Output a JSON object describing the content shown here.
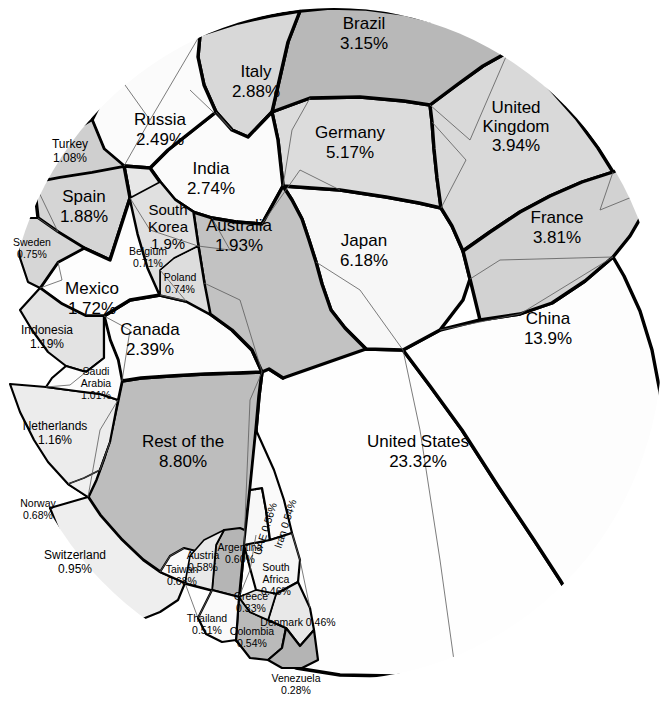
{
  "chart_data": {
    "type": "treemap",
    "subtype": "voronoi-treemap",
    "title": "",
    "subtitle": "",
    "xlabel": "",
    "ylabel": "",
    "unit": "percent",
    "legend": "none",
    "grid": false,
    "categories": [
      "United States",
      "China",
      "Rest of the World",
      "Japan",
      "Germany",
      "United Kingdom",
      "France",
      "Brazil",
      "Italy",
      "India",
      "Russia",
      "Canada",
      "Australia",
      "South Korea",
      "Spain",
      "Mexico",
      "Indonesia",
      "Netherlands",
      "Turkey",
      "Saudi Arabia",
      "Switzerland",
      "Sweden",
      "Poland",
      "Belgium",
      "Taiwan",
      "Norway",
      "Argentina",
      "Austria",
      "UAE",
      "Iran",
      "Colombia",
      "Thailand",
      "South Africa",
      "Denmark",
      "Greece",
      "Venezuela"
    ],
    "values": [
      23.32,
      13.9,
      8.8,
      6.18,
      5.17,
      3.94,
      3.81,
      3.15,
      2.88,
      2.74,
      2.49,
      2.39,
      1.93,
      1.9,
      1.88,
      1.72,
      1.19,
      1.16,
      1.08,
      1.01,
      0.95,
      0.75,
      0.74,
      0.71,
      0.68,
      0.68,
      0.6,
      0.58,
      0.56,
      0.54,
      0.54,
      0.51,
      0.46,
      0.46,
      0.33,
      0.28
    ],
    "value_labels": [
      "23.32%",
      "13.9%",
      "8.80%",
      "6.18%",
      "5.17%",
      "3.94%",
      "3.81%",
      "3.15%",
      "2.88%",
      "2.74%",
      "2.49%",
      "2.39%",
      "1.93%",
      "1.9%",
      "1.88%",
      "1.72%",
      "1.19%",
      "1.16%",
      "1.08%",
      "1.01%",
      "0.95%",
      "0.75%",
      "0.74%",
      "0.71%",
      "0.68%",
      "0.68%",
      "0.60%",
      "0.58%",
      "0.56%",
      "0.54%",
      "0.54%",
      "0.51%",
      "0.46%",
      "0.46%",
      "0.33%",
      "0.28%"
    ]
  },
  "cells": [
    {
      "id": "united-states",
      "name": "United States",
      "value": "23.32%",
      "fill": "#fefefe",
      "label_x": 418,
      "label_y": 453,
      "label_size": "lab-lg",
      "rotate": 0,
      "two_line": true,
      "stroke": "lvl-major",
      "points": "283,378 269,369 265,366 262,372 259,396 256,430 250,490 244,545 239,597 236,640 247,650 296,668 340,675 395,676 455,668 512,650 557,628 580,613 560,580 534,540 498,486 462,430 430,386 403,350 366,349 336,350 310,360"
    },
    {
      "id": "china",
      "name": "China",
      "value": "13.9%",
      "fill": "#fdfdfd",
      "label_x": 548,
      "label_y": 330,
      "label_size": "lab-lg",
      "rotate": 0,
      "two_line": true,
      "stroke": "lvl-major",
      "points": "403,350 430,386 462,430 498,486 534,540 560,580 580,613 610,585 632,552 648,515 658,476 662,434 660,392 652,350 640,311 624,276 613,257 585,281 552,303 520,314 480,320 440,330"
    },
    {
      "id": "rest-of-the-world",
      "name": "Rest of the World",
      "value": "8.80%",
      "fill": "#bdbdbd",
      "label_x": 183,
      "label_y": 453,
      "label_size": "lab-lg",
      "rotate": 0,
      "two_line": true,
      "three_line": true,
      "stroke": "lvl-major",
      "points": "262,372 259,396 256,430 250,490 244,545 239,597 212,590 185,583 160,572 143,560 122,540 100,515 88,497 96,480 104,458 112,428 118,400 122,381 141,378 170,376 205,374 237,373"
    },
    {
      "id": "japan",
      "name": "Japan",
      "value": "6.18%",
      "fill": "#f7f7f7",
      "label_x": 364,
      "label_y": 252,
      "label_size": "lab-lg",
      "rotate": 0,
      "two_line": true,
      "stroke": "lvl-major",
      "points": "283,186 292,200 302,219 309,240 316,262 322,284 331,310 345,328 366,349 403,350 440,330 463,300 470,279 463,251 452,226 441,208 419,203 386,197 340,190"
    },
    {
      "id": "germany",
      "name": "Germany",
      "value": "5.17%",
      "fill": "#dcdcdc",
      "label_x": 350,
      "label_y": 144,
      "label_size": "lab-lg",
      "rotate": 0,
      "two_line": true,
      "stroke": "lvl-major",
      "points": "272,112 278,140 283,186 340,190 386,197 419,203 441,208 437,178 434,149 432,122 430,105 404,101 360,97 310,98"
    },
    {
      "id": "united-kingdom",
      "name": "United Kingdom",
      "value": "3.94%",
      "fill": "#d9d9d9",
      "label_x": 516,
      "label_y": 128,
      "label_size": "lab-lg",
      "rotate": 0,
      "two_line": true,
      "three_line": true,
      "stroke": "lvl-major",
      "points": "430,105 432,122 434,149 437,178 441,208 452,226 463,251 490,232 520,212 550,196 582,182 613,172 598,148 576,118 552,91 530,68 508,52 483,66 458,84"
    },
    {
      "id": "france",
      "name": "France",
      "value": "3.81%",
      "fill": "#d2d2d2",
      "label_x": 557,
      "label_y": 229,
      "label_size": "lab-lg",
      "rotate": 0,
      "two_line": true,
      "stroke": "lvl-major",
      "points": "463,251 470,279 480,320 520,314 552,303 585,281 613,257 630,236 644,212 654,188 660,166 622,168 613,172 582,182 550,196 520,212 490,232"
    },
    {
      "id": "brazil",
      "name": "Brazil",
      "value": "3.15%",
      "fill": "#b8b8b8",
      "label_x": 364,
      "label_y": 35,
      "label_size": "lab-lg",
      "rotate": 0,
      "two_line": true,
      "stroke": "lvl-major",
      "points": "272,112 310,98 360,97 404,101 430,105 458,84 483,66 508,52 476,36 440,23 404,14 366,9 330,8 300,11 288,42"
    },
    {
      "id": "italy",
      "name": "Italy",
      "value": "2.88%",
      "fill": "#d8d8d8",
      "label_x": 256,
      "label_y": 83,
      "label_size": "lab-lg",
      "rotate": 0,
      "two_line": true,
      "stroke": "lvl-major",
      "points": "200,35 198,57 204,85 216,112 232,130 248,137 272,112 288,42 300,11 270,16 238,23"
    },
    {
      "id": "india",
      "name": "India",
      "value": "2.74%",
      "fill": "#fbfbfb",
      "label_x": 211,
      "label_y": 180,
      "label_size": "lab-lg",
      "rotate": 0,
      "two_line": true,
      "stroke": "lvl-major",
      "points": "150,168 160,182 175,200 193,212 212,218 236,222 262,224 283,186 278,140 272,112 248,137 232,130 216,112 192,131 168,150"
    },
    {
      "id": "russia",
      "name": "Russia",
      "value": "2.49%",
      "fill": "#fbfbfb",
      "label_x": 160,
      "label_y": 131,
      "label_size": "lab-lg",
      "rotate": 0,
      "two_line": true,
      "stroke": "lvl-major",
      "points": "92,120 104,149 124,166 150,168 168,150 192,131 216,112 204,85 198,57 200,35 170,46 144,60 120,78 104,96"
    },
    {
      "id": "canada",
      "name": "Canada",
      "value": "2.39%",
      "fill": "#fcfcfc",
      "label_x": 150,
      "label_y": 341,
      "label_size": "lab-lg",
      "rotate": 0,
      "two_line": true,
      "stroke": "lvl-major",
      "points": "104,316 110,340 118,360 122,381 141,378 170,376 205,374 237,373 262,372 252,350 232,330 210,314 186,301 160,295 130,300"
    },
    {
      "id": "australia",
      "name": "Australia",
      "value": "1.93%",
      "fill": "#c2c2c2",
      "label_x": 239,
      "label_y": 237,
      "label_size": "lab-lg",
      "rotate": 0,
      "two_line": true,
      "stroke": "lvl-major",
      "points": "193,212 212,218 236,222 262,224 283,186 292,200 302,219 309,240 316,262 322,284 331,310 345,328 366,349 283,378 269,369 262,372 252,350 232,330 210,314 204,283 198,246"
    },
    {
      "id": "south-korea",
      "name": "South Korea",
      "value": "1.9%",
      "fill": "#e7e7e7",
      "label_x": 168,
      "label_y": 228,
      "label_size": "lab-md",
      "rotate": 0,
      "two_line": true,
      "three_line": true,
      "stroke": "lvl-major",
      "points": "124,166 150,168 160,182 175,200 193,212 198,246 204,283 186,301 160,295 148,268 138,234 130,198"
    },
    {
      "id": "spain",
      "name": "Spain",
      "value": "1.88%",
      "fill": "#d5d5d5",
      "label_x": 84,
      "label_y": 208,
      "label_size": "lab-lg",
      "rotate": 0,
      "two_line": true,
      "stroke": "lvl-major",
      "points": "38,218 58,232 84,248 110,260 130,198 124,166 92,172 60,177 34,182"
    },
    {
      "id": "mexico",
      "name": "Mexico",
      "value": "1.72%",
      "fill": "#fdfdfd",
      "label_x": 92,
      "label_y": 300,
      "label_size": "lab-lg",
      "rotate": 0,
      "two_line": true,
      "stroke": "lvl-major",
      "points": "40,288 62,304 86,316 104,316 130,300 160,295 148,268 138,234 130,198 110,260 84,248 58,262"
    },
    {
      "id": "indonesia",
      "name": "Indonesia",
      "value": "1.19%",
      "fill": "#e3e3e3",
      "label_x": 47,
      "label_y": 338,
      "label_size": "lab-sm",
      "rotate": 0,
      "two_line": true,
      "stroke": "lvl-mid",
      "points": "20,310 32,330 48,352 66,366 86,372 104,358 104,316 86,316 62,304 40,288"
    },
    {
      "id": "netherlands",
      "name": "Netherlands",
      "value": "1.16%",
      "fill": "#ececec",
      "label_x": 55,
      "label_y": 434,
      "label_size": "lab-sm",
      "rotate": 0,
      "two_line": true,
      "stroke": "lvl-mid",
      "points": "10,384 20,412 34,440 48,462 68,484 88,497 100,470 110,442 118,400 100,394 76,391 46,387"
    },
    {
      "id": "turkey",
      "name": "Turkey",
      "value": "1.08%",
      "fill": "#cfcfcf",
      "label_x": 70,
      "label_y": 152,
      "label_size": "lab-sm",
      "rotate": 0,
      "two_line": true,
      "stroke": "lvl-mid",
      "points": "34,182 60,177 92,172 124,166 104,149 92,120 70,133 50,150 38,166"
    },
    {
      "id": "saudi-arabia",
      "name": "Saudi Arabia",
      "value": "1.01%",
      "fill": "#fcfcfc",
      "label_x": 96,
      "label_y": 384,
      "label_size": "lab-xs",
      "rotate": 0,
      "two_line": true,
      "three_line": true,
      "stroke": "lvl-mid",
      "points": "46,387 76,391 100,394 118,400 122,381 118,360 110,340 104,316 104,358 86,372 66,366 52,378"
    },
    {
      "id": "switzerland",
      "name": "Switzerland",
      "value": "0.95%",
      "fill": "#eeeeee",
      "label_x": 75,
      "label_y": 563,
      "label_size": "lab-sm",
      "rotate": 0,
      "two_line": true,
      "stroke": "lvl-mid",
      "points": "88,497 100,515 122,540 143,560 160,572 185,583 178,600 160,612 140,620 118,612 100,596 82,574 68,552 58,528 50,508"
    },
    {
      "id": "sweden",
      "name": "Sweden",
      "value": "0.75%",
      "fill": "#d6d6d6",
      "label_x": 32,
      "label_y": 249,
      "label_size": "lab-xs",
      "rotate": 0,
      "two_line": true,
      "stroke": "lvl-mid",
      "points": "16,230 20,258 28,282 40,288 58,262 84,248 58,232 38,218 24,218"
    },
    {
      "id": "poland",
      "name": "Poland",
      "value": "0.74%",
      "fill": "#dddddd",
      "label_x": 180,
      "label_y": 284,
      "label_size": "lab-xs",
      "rotate": 0,
      "two_line": true,
      "stroke": "lvl-minor",
      "points": "160,295 186,301 210,314 204,283 198,246 174,258 160,270"
    },
    {
      "id": "belgium",
      "name": "Belgium",
      "value": "0.71%",
      "fill": "#e0e0e0",
      "label_x": 148,
      "label_y": 258,
      "label_size": "lab-xs",
      "rotate": 0,
      "two_line": true,
      "stroke": "lvl-minor",
      "points": "130,198 138,234 148,268 160,295 160,270 174,258 198,246 193,212 175,200 160,182"
    },
    {
      "id": "taiwan",
      "name": "Taiwan",
      "value": "0.68%",
      "fill": "#fafafa",
      "label_x": 182,
      "label_y": 576,
      "label_size": "lab-xs",
      "rotate": 0,
      "two_line": true,
      "stroke": "lvl-mid",
      "points": "160,572 185,583 212,590 224,576 216,562 200,552 184,548 170,556"
    },
    {
      "id": "norway",
      "name": "Norway",
      "value": "0.68%",
      "fill": "#f0f0f0",
      "label_x": 38,
      "label_y": 510,
      "label_size": "lab-xs",
      "rotate": 0,
      "two_line": true,
      "stroke": "lvl-minor",
      "points": "68,484 88,497 96,480 104,458 110,442 100,470 84,478"
    },
    {
      "id": "argentina",
      "name": "Argentina",
      "value": "0.60%",
      "fill": "#b5b5b5",
      "label_x": 240,
      "label_y": 554,
      "label_size": "lab-xs",
      "rotate": 0,
      "two_line": true,
      "stroke": "lvl-mid",
      "points": "212,590 239,597 244,545 250,543 256,535 240,528 224,530 216,545"
    },
    {
      "id": "austria",
      "name": "Austria",
      "value": "0.58%",
      "fill": "#e9e9e9",
      "label_x": 203,
      "label_y": 562,
      "label_size": "lab-xs",
      "rotate": 0,
      "two_line": true,
      "stroke": "lvl-minor",
      "points": "185,583 212,590 216,545 224,530 204,540 190,556"
    },
    {
      "id": "uae",
      "name": "UAE",
      "value": "0.56%",
      "fill": "#f8f8f8",
      "label_x": 266,
      "label_y": 529,
      "label_size": "lab-xs",
      "rotate": -72,
      "inline": true,
      "stroke": "lvl-mid",
      "points": "244,545 250,490 262,488 266,510 270,540 260,545"
    },
    {
      "id": "iran",
      "name": "Iran",
      "value": "0.54%",
      "fill": "#fbfbfb",
      "label_x": 286,
      "label_y": 524,
      "label_size": "lab-xs",
      "rotate": -72,
      "inline": true,
      "stroke": "lvl-mid",
      "points": "250,490 256,430 274,470 284,500 292,533 270,540 266,510 262,488"
    },
    {
      "id": "colombia",
      "name": "Colombia",
      "value": "0.54%",
      "fill": "#bababa",
      "label_x": 252,
      "label_y": 638,
      "label_size": "lab-xs",
      "rotate": 0,
      "two_line": true,
      "stroke": "lvl-mid",
      "points": "236,640 239,597 250,612 268,620 286,628 282,648 268,660 250,658"
    },
    {
      "id": "thailand",
      "name": "Thailand",
      "value": "0.51%",
      "fill": "#fafafa",
      "label_x": 207,
      "label_y": 625,
      "label_size": "lab-xs",
      "rotate": 0,
      "two_line": true,
      "stroke": "lvl-mid",
      "points": "212,590 239,597 236,640 222,642 206,634 198,618"
    },
    {
      "id": "south-africa",
      "name": "South Africa",
      "value": "0.46%",
      "fill": "#f6f6f6",
      "label_x": 276,
      "label_y": 580,
      "label_size": "lab-xs",
      "rotate": 0,
      "two_line": true,
      "stroke": "lvl-mid",
      "points": "244,545 270,540 292,533 300,560 298,582 276,594 256,590 250,568"
    },
    {
      "id": "denmark",
      "name": "Denmark",
      "value": "0.46%",
      "fill": "#e8e8e8",
      "label_x": 298,
      "label_y": 623,
      "label_size": "lab-xs",
      "rotate": 0,
      "inline": true,
      "stroke": "lvl-mid",
      "points": "276,594 298,582 310,608 314,630 300,646 286,628 268,620"
    },
    {
      "id": "greece",
      "name": "Greece",
      "value": "0.33%",
      "fill": "#e2e2e2",
      "label_x": 251,
      "label_y": 603,
      "label_size": "lab-xs",
      "rotate": 0,
      "two_line": true,
      "stroke": "lvl-minor",
      "points": "239,597 256,590 276,594 268,620 250,612"
    },
    {
      "id": "venezuela",
      "name": "Venezuela",
      "value": "0.28%",
      "fill": "#b4b4b4",
      "label_x": 296,
      "label_y": 685,
      "label_size": "lab-xs",
      "rotate": 0,
      "two_line": true,
      "stroke": "lvl-mid",
      "points": "268,660 282,648 286,628 300,646 314,630 318,660 302,668 282,668"
    }
  ],
  "hairlines": [
    "120,78 150,120 200,35",
    "150,120 124,166",
    "216,112 232,130 190,90",
    "262,224 300,170 340,190",
    "283,186 292,130 310,98",
    "432,122 466,160 441,208",
    "430,105 470,140 508,52",
    "613,172 600,210 654,188",
    "470,279 500,260 613,257",
    "440,330 520,314 613,257",
    "580,613 632,552 662,434",
    "403,350 420,430 440,560 455,668",
    "262,372 250,400 244,545",
    "204,283 240,300 262,372",
    "130,198 150,230 198,246",
    "104,316 130,330 122,381",
    "118,400 100,430 88,497",
    "86,372 70,385 46,387",
    "58,262 62,280 40,288",
    "110,442 100,470 84,478 68,484",
    "160,572 170,556 184,548",
    "239,597 250,570 256,535",
    "316,262 360,290 403,350",
    "212,218 230,250 198,246",
    "292,533 300,560 310,608",
    "160,295 186,301 160,270",
    "38,218 58,232 34,182",
    "185,583 198,618 212,590"
  ],
  "outer": {
    "cx": 334,
    "cy": 344,
    "rx": 328,
    "ry": 336,
    "ring_fill": "#f2f2f2"
  }
}
